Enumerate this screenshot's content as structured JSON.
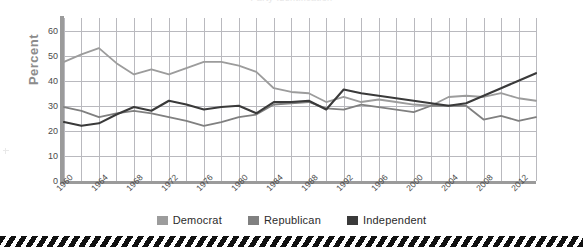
{
  "title": {
    "text": "Party Identification"
  },
  "axes": {
    "ylabel": "Percent",
    "yticks": [
      "60",
      "50",
      "40",
      "30",
      "20",
      "10",
      "0"
    ],
    "xticks": [
      "1960",
      "1964",
      "1968",
      "1972",
      "1976",
      "1980",
      "1984",
      "1988",
      "1992",
      "1996",
      "2000",
      "2004",
      "2008",
      "2012"
    ]
  },
  "legend": {
    "items": [
      {
        "label": "Democrat",
        "color": "#9c9c9c"
      },
      {
        "label": "Republican",
        "color": "#808080"
      },
      {
        "label": "Independent",
        "color": "#3a3a3a"
      }
    ]
  },
  "chart_data": {
    "type": "line",
    "title": "Party Identification",
    "xlabel": "",
    "ylabel": "Percent",
    "ylim": [
      0,
      65
    ],
    "xlim": [
      1960,
      2014
    ],
    "grid": true,
    "legend_position": "bottom",
    "x": [
      1960,
      1962,
      1964,
      1966,
      1968,
      1970,
      1972,
      1974,
      1976,
      1978,
      1980,
      1982,
      1984,
      1986,
      1988,
      1990,
      1992,
      1994,
      1996,
      1998,
      2000,
      2002,
      2004,
      2006,
      2008,
      2010,
      2012,
      2014
    ],
    "series": [
      {
        "name": "Democrat",
        "color": "#9c9c9c",
        "values": [
          47.5,
          50.5,
          53.0,
          47.0,
          42.5,
          44.5,
          42.5,
          45.0,
          47.5,
          47.5,
          46.0,
          43.5,
          37.0,
          35.5,
          35.0,
          31.5,
          33.5,
          31.5,
          32.5,
          31.5,
          30.5,
          30.0,
          33.5,
          34.0,
          33.5,
          35.0,
          33.0,
          32.0
        ]
      },
      {
        "name": "Republican",
        "color": "#808080",
        "values": [
          29.5,
          28.0,
          25.5,
          27.0,
          28.0,
          27.0,
          25.5,
          24.0,
          22.0,
          23.5,
          25.5,
          26.5,
          30.5,
          31.0,
          31.5,
          29.0,
          28.5,
          30.5,
          29.5,
          28.5,
          27.5,
          30.0,
          30.0,
          30.0,
          24.5,
          26.0,
          24.0,
          25.5
        ]
      },
      {
        "name": "Independent",
        "color": "#3a3a3a",
        "values": [
          23.5,
          22.0,
          23.0,
          26.5,
          29.5,
          28.0,
          32.0,
          30.5,
          28.5,
          29.5,
          30.0,
          27.0,
          31.5,
          31.5,
          32.0,
          28.5,
          36.5,
          35.0,
          34.0,
          33.0,
          32.0,
          31.0,
          30.0,
          31.0,
          34.0,
          37.0,
          40.0,
          43.0
        ]
      }
    ]
  }
}
